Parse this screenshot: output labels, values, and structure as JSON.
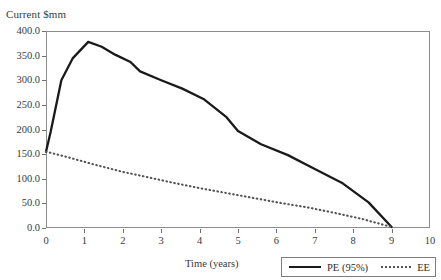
{
  "chart_data": {
    "type": "line",
    "title": "",
    "ylabel": "Current $mm",
    "xlabel": "Time (years)",
    "xlim": [
      0,
      10
    ],
    "ylim": [
      0,
      400
    ],
    "xticks": [
      "0",
      "1",
      "2",
      "3",
      "4",
      "5",
      "6",
      "7",
      "8",
      "9",
      "10"
    ],
    "yticks": [
      "0.0",
      "50.0",
      "100.0",
      "150.0",
      "200.0",
      "250.0",
      "300.0",
      "350.0",
      "400.0"
    ],
    "grid": false,
    "legend_position": "bottom-right",
    "series": [
      {
        "name": "PE (95%)",
        "style": "solid",
        "color": "#1a1a1a",
        "x": [
          0.0,
          0.12,
          0.4,
          0.7,
          1.1,
          1.45,
          1.8,
          2.2,
          2.45,
          3.0,
          3.55,
          4.1,
          4.7,
          5.0,
          5.6,
          6.3,
          7.0,
          7.7,
          8.4,
          9.0
        ],
        "y": [
          155.0,
          195.0,
          300.0,
          345.0,
          378.0,
          368.0,
          352.0,
          337.0,
          318.0,
          300.0,
          283.0,
          262.0,
          225.0,
          197.0,
          170.0,
          148.0,
          120.0,
          92.0,
          52.0,
          2.0
        ]
      },
      {
        "name": "EE",
        "style": "dotted",
        "color": "#545454",
        "x": [
          0.0,
          0.6,
          1.3,
          2.0,
          2.6,
          3.3,
          4.0,
          4.7,
          5.4,
          6.1,
          6.8,
          7.5,
          8.2,
          9.0
        ],
        "y": [
          155.0,
          143.0,
          128.0,
          114.0,
          104.0,
          92.0,
          81.0,
          71.0,
          61.0,
          51.0,
          42.0,
          31.0,
          19.0,
          2.0
        ]
      }
    ]
  },
  "legend": {
    "pe_label": "PE (95%)",
    "ee_label": "EE"
  },
  "axes": {
    "y_title": "Current $mm",
    "x_title": "Time (years)"
  },
  "colors": {
    "pe_line": "#1a1a1a",
    "ee_line": "#545454",
    "frame": "#8c8c8c",
    "text": "#2b2b2b",
    "background": "#ffffff"
  }
}
